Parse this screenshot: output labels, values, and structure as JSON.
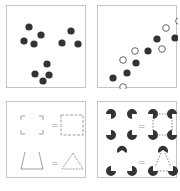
{
  "figure": {
    "panels": [
      {
        "id": "proximity",
        "dots": [
          [
            22,
            21
          ],
          [
            17,
            35
          ],
          [
            27,
            38
          ],
          [
            34,
            29
          ],
          [
            64,
            25
          ],
          [
            55,
            37
          ],
          [
            71,
            38
          ],
          [
            40,
            58
          ],
          [
            28,
            68
          ],
          [
            42,
            69
          ],
          [
            36,
            75
          ]
        ],
        "dot_color": "#333333"
      },
      {
        "id": "similarity",
        "filled": [
          [
            15,
            72
          ],
          [
            29,
            67
          ],
          [
            38,
            57
          ],
          [
            50,
            45
          ],
          [
            59,
            33
          ],
          [
            77,
            32
          ]
        ],
        "hollow": [
          [
            25,
            81
          ],
          [
            25,
            54
          ],
          [
            37,
            45
          ],
          [
            64,
            43
          ],
          [
            68,
            22
          ],
          [
            81,
            15
          ]
        ],
        "filled_color": "#333333",
        "hollow_stroke": "#555555"
      },
      {
        "id": "closure",
        "equals_symbol": "=",
        "line_color": "#888888"
      },
      {
        "id": "illusory-contours",
        "equals_symbol": "=",
        "pacman_color": "#333333"
      }
    ]
  }
}
